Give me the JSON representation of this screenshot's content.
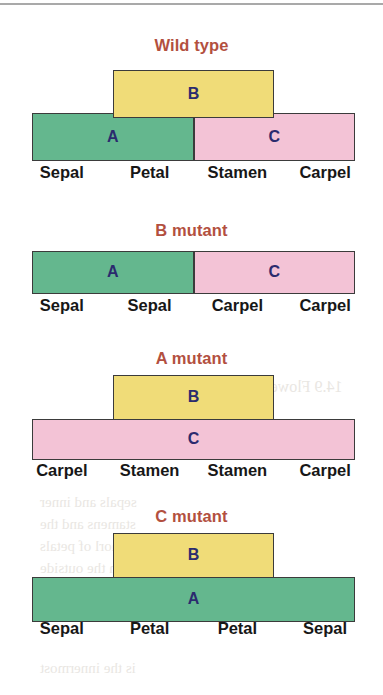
{
  "figure": {
    "letter_color": "#2b2b6e",
    "title_color": "#b3503f",
    "outline_color": "#3b3b3b",
    "colors": {
      "A": "#64b78e",
      "B": "#f0dc78",
      "C": "#f3c3d6"
    },
    "organ_positions": [
      "1",
      "2",
      "3",
      "4"
    ]
  },
  "panels": [
    {
      "title": "Wild type",
      "top_boxes": [
        {
          "label": "B",
          "gene": "B",
          "color_key": "B",
          "start": 1,
          "span": 2
        }
      ],
      "bottom_boxes": [
        {
          "label": "A",
          "gene": "A",
          "color_key": "A",
          "start": 0,
          "span": 2
        },
        {
          "label": "C",
          "gene": "C",
          "color_key": "C",
          "start": 2,
          "span": 2
        }
      ],
      "organs": [
        "Sepal",
        "Petal",
        "Stamen",
        "Carpel"
      ]
    },
    {
      "title": "B mutant",
      "top_boxes": [],
      "bottom_boxes": [
        {
          "label": "A",
          "gene": "A",
          "color_key": "A",
          "start": 0,
          "span": 2
        },
        {
          "label": "C",
          "gene": "C",
          "color_key": "C",
          "start": 2,
          "span": 2
        }
      ],
      "organs": [
        "Sepal",
        "Sepal",
        "Carpel",
        "Carpel"
      ]
    },
    {
      "title": "A mutant",
      "top_boxes": [
        {
          "label": "B",
          "gene": "B",
          "color_key": "B",
          "start": 1,
          "span": 2
        }
      ],
      "bottom_boxes": [
        {
          "label": "C",
          "gene": "C",
          "color_key": "C",
          "start": 0,
          "span": 4
        }
      ],
      "organs": [
        "Carpel",
        "Stamen",
        "Stamen",
        "Carpel"
      ]
    },
    {
      "title": "C mutant",
      "top_boxes": [
        {
          "label": "B",
          "gene": "B",
          "color_key": "B",
          "start": 1,
          "span": 2
        }
      ],
      "bottom_boxes": [
        {
          "label": "A",
          "gene": "A",
          "color_key": "A",
          "start": 0,
          "span": 4
        }
      ],
      "organs": [
        "Sepal",
        "Petal",
        "Petal",
        "Sepal"
      ]
    }
  ],
  "bleed_text": [
    {
      "text": "B variant",
      "x": 190,
      "y": 95,
      "size": 17
    },
    {
      "text": "14.9  Flower Development",
      "x": 175,
      "y": 378,
      "size": 16
    },
    {
      "text": "sepals and inner",
      "x": 40,
      "y": 494,
      "size": 15
    },
    {
      "text": "stamens and the",
      "x": 40,
      "y": 516,
      "size": 15
    },
    {
      "text": "whorl of petals",
      "x": 40,
      "y": 538,
      "size": 15
    },
    {
      "text": "on the outside",
      "x": 40,
      "y": 560,
      "size": 15
    },
    {
      "text": "which are found",
      "x": 40,
      "y": 582,
      "size": 15
    },
    {
      "text": "studied in more",
      "x": 40,
      "y": 604,
      "size": 15
    },
    {
      "text": "is the innermost",
      "x": 40,
      "y": 660,
      "size": 15
    }
  ]
}
